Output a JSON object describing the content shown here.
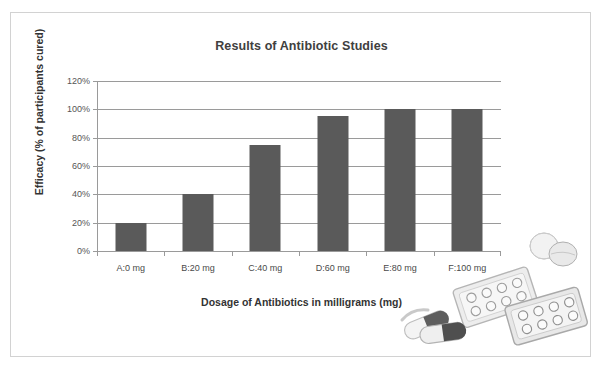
{
  "chart_data": {
    "type": "bar",
    "title": "Results of Antibiotic Studies",
    "xlabel": "Dosage of Antibiotics in milligrams (mg)",
    "ylabel": "Efficacy (% of participants cured)",
    "categories": [
      "A:0 mg",
      "B:20 mg",
      "C:40 mg",
      "D:60 mg",
      "E:80 mg",
      "F:100 mg"
    ],
    "values": [
      20,
      40,
      75,
      95,
      100,
      100
    ],
    "ylim": [
      0,
      120
    ],
    "ytick_labels": [
      "0%",
      "20%",
      "40%",
      "60%",
      "80%",
      "100%",
      "120%"
    ],
    "ytick_values": [
      0,
      20,
      40,
      60,
      80,
      100,
      120
    ],
    "grid": "horizontal",
    "legend": "none",
    "bar_color": "#5a5a5a",
    "gridline_color": "#9a9a9a",
    "axis_color": "#9a9a9a",
    "background_color": "#ffffff",
    "border_color": "#d2d2d2"
  },
  "decoration": {
    "clipart_name": "pills-and-blister-packs-clipart"
  }
}
